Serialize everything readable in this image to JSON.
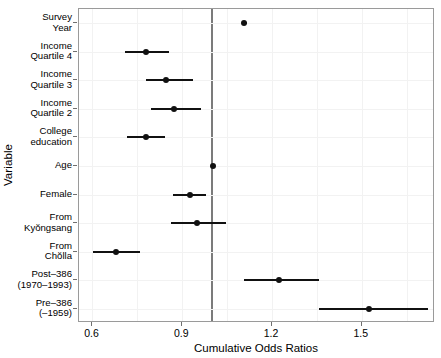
{
  "chart_data": {
    "type": "scatter",
    "subtype": "forest-plot",
    "title": "",
    "xlabel": "Cumulative Odds Ratios",
    "ylabel": "Variable",
    "xlim": [
      0.555,
      1.745
    ],
    "xticks": [
      0.6,
      0.9,
      1.2,
      1.5
    ],
    "xticklabels": [
      "0.6",
      "0.9",
      "1.2",
      "1.5"
    ],
    "grid": true,
    "legend": "none",
    "reference_line": 1.0,
    "categories": [
      "Survey Year",
      "Income Quartile 4",
      "Income Quartile 3",
      "Income Quartile 2",
      "College education",
      "Age",
      "Female",
      "From Kyŏngsang",
      "From Chŏlla",
      "Post-386 (1970-1993)",
      "Pre-386 (-1959)"
    ],
    "points": [
      {
        "label_line1": "Survey",
        "label_line2": "Year",
        "estimate": 1.107,
        "ci_low": 1.099,
        "ci_high": 1.115
      },
      {
        "label_line1": "Income",
        "label_line2": "Quartile 4",
        "estimate": 0.78,
        "ci_low": 0.71,
        "ci_high": 0.857
      },
      {
        "label_line1": "Income",
        "label_line2": "Quartile 3",
        "estimate": 0.847,
        "ci_low": 0.78,
        "ci_high": 0.937
      },
      {
        "label_line1": "Income",
        "label_line2": "Quartile 2",
        "estimate": 0.873,
        "ci_low": 0.797,
        "ci_high": 0.963
      },
      {
        "label_line1": "College",
        "label_line2": "education",
        "estimate": 0.78,
        "ci_low": 0.717,
        "ci_high": 0.843
      },
      {
        "label_line1": "Age",
        "label_line2": "",
        "estimate": 1.003,
        "ci_low": 0.997,
        "ci_high": 1.01
      },
      {
        "label_line1": "Female",
        "label_line2": "",
        "estimate": 0.927,
        "ci_low": 0.87,
        "ci_high": 0.98
      },
      {
        "label_line1": "From",
        "label_line2": "Kyŏngsang",
        "estimate": 0.95,
        "ci_low": 0.863,
        "ci_high": 1.047
      },
      {
        "label_line1": "From",
        "label_line2": "Chŏlla",
        "estimate": 0.68,
        "ci_low": 0.603,
        "ci_high": 0.76
      },
      {
        "label_line1": "Post–386",
        "label_line2": "(1970–1993)",
        "estimate": 1.223,
        "ci_low": 1.107,
        "ci_high": 1.357
      },
      {
        "label_line1": "Pre–386",
        "label_line2": "(–1959)",
        "estimate": 1.523,
        "ci_low": 1.357,
        "ci_high": 1.72
      }
    ]
  },
  "colors": {
    "point": "#111111",
    "ci": "#111111",
    "reference_line": "#7b7b7b",
    "grid": "#f2f2f2",
    "panel_border": "#9a9a9a",
    "background": "#ffffff"
  }
}
